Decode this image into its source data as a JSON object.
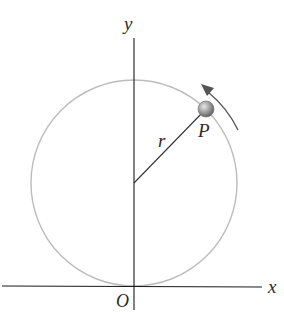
{
  "diagram": {
    "labels": {
      "y_axis": "y",
      "x_axis": "x",
      "origin": "O",
      "radius": "r",
      "point": "P"
    },
    "colors": {
      "axis": "#1a1a1a",
      "circle": "#bcbcbc",
      "radius_line": "#333333",
      "particle": "#8a8a8a",
      "arrow": "#555555"
    },
    "geometry": {
      "center": [
        134,
        183
      ],
      "radius_px": 103,
      "point_P": [
        206,
        109
      ],
      "motion_direction": "counterclockwise"
    }
  }
}
